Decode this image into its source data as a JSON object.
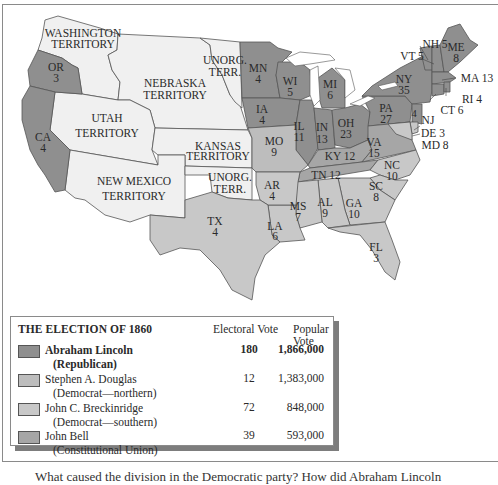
{
  "figure": {
    "type": "map"
  },
  "colors": {
    "lincoln": "#8f8f8f",
    "douglas": "#bdbdbd",
    "breckinridge": "#c8c8c8",
    "bell": "#a6a6a6",
    "territory": "#f0f0f0",
    "water": "#ffffff",
    "border": "#555555"
  },
  "territories": [
    {
      "id": "washington",
      "label": "WASHINGTON",
      "label2": "TERRITORY"
    },
    {
      "id": "nebraska",
      "label": "NEBRASKA",
      "label2": "TERRITORY"
    },
    {
      "id": "unorg-north",
      "label": "UNORG.",
      "label2": "TERR."
    },
    {
      "id": "utah",
      "label": "UTAH",
      "label2": "TERRITORY"
    },
    {
      "id": "kansas",
      "label": "KANSAS",
      "label2": "TERRITORY"
    },
    {
      "id": "new-mexico",
      "label": "NEW MEXICO",
      "label2": "TERRITORY"
    },
    {
      "id": "unorg-south",
      "label": "UNORG.",
      "label2": "TERR."
    }
  ],
  "states": [
    {
      "abbr": "OR",
      "ev": "3",
      "winner": "lincoln"
    },
    {
      "abbr": "CA",
      "ev": "4",
      "winner": "lincoln"
    },
    {
      "abbr": "MN",
      "ev": "4",
      "winner": "lincoln"
    },
    {
      "abbr": "WI",
      "ev": "5",
      "winner": "lincoln"
    },
    {
      "abbr": "MI",
      "ev": "6",
      "winner": "lincoln"
    },
    {
      "abbr": "IA",
      "ev": "4",
      "winner": "lincoln"
    },
    {
      "abbr": "IL",
      "ev": "11",
      "winner": "lincoln"
    },
    {
      "abbr": "IN",
      "ev": "13",
      "winner": "lincoln"
    },
    {
      "abbr": "OH",
      "ev": "23",
      "winner": "lincoln"
    },
    {
      "abbr": "PA",
      "ev": "27",
      "winner": "lincoln"
    },
    {
      "abbr": "NY",
      "ev": "35",
      "winner": "lincoln"
    },
    {
      "abbr": "NH",
      "ev": "5",
      "winner": "lincoln"
    },
    {
      "abbr": "VT",
      "ev": "5",
      "winner": "lincoln"
    },
    {
      "abbr": "ME",
      "ev": "8",
      "winner": "lincoln"
    },
    {
      "abbr": "MA",
      "ev": "13",
      "winner": "lincoln"
    },
    {
      "abbr": "RI",
      "ev": "4",
      "winner": "lincoln"
    },
    {
      "abbr": "CT",
      "ev": "6",
      "winner": "lincoln"
    },
    {
      "abbr": "NJ",
      "ev": "4",
      "winner": "lincoln"
    },
    {
      "abbr": "MO",
      "ev": "9",
      "winner": "douglas"
    },
    {
      "abbr": "KY",
      "ev": "12",
      "winner": "bell"
    },
    {
      "abbr": "VA",
      "ev": "15",
      "winner": "bell"
    },
    {
      "abbr": "TN",
      "ev": "12",
      "winner": "bell"
    },
    {
      "abbr": "DE",
      "ev": "3",
      "winner": "breckinridge"
    },
    {
      "abbr": "MD",
      "ev": "8",
      "winner": "breckinridge"
    },
    {
      "abbr": "NC",
      "ev": "10",
      "winner": "breckinridge"
    },
    {
      "abbr": "SC",
      "ev": "8",
      "winner": "breckinridge"
    },
    {
      "abbr": "GA",
      "ev": "10",
      "winner": "breckinridge"
    },
    {
      "abbr": "FL",
      "ev": "3",
      "winner": "breckinridge"
    },
    {
      "abbr": "AL",
      "ev": "9",
      "winner": "breckinridge"
    },
    {
      "abbr": "MS",
      "ev": "7",
      "winner": "breckinridge"
    },
    {
      "abbr": "LA",
      "ev": "6",
      "winner": "breckinridge"
    },
    {
      "abbr": "AR",
      "ev": "4",
      "winner": "breckinridge"
    },
    {
      "abbr": "TX",
      "ev": "4",
      "winner": "breckinridge"
    }
  ],
  "callouts": {
    "nh": "NH 5",
    "vt": "VT 5",
    "ma": "MA 13",
    "ri": "RI 4",
    "ct": "CT 6",
    "nj": "NJ",
    "nj_ev": "4",
    "de": "DE 3",
    "md": "MD 8",
    "ky": "KY 12",
    "tn": "TN 12"
  },
  "legend": {
    "title": "THE ELECTION OF 1860",
    "col_electoral": "Electoral Vote",
    "col_popular": "Popular Vote",
    "rows": [
      {
        "name": "Abraham Lincoln",
        "party": "(Republican)",
        "electoral": "180",
        "popular": "1,866,000",
        "key": "lincoln",
        "bold": true
      },
      {
        "name": "Stephen A. Douglas",
        "party": "(Democrat—northern)",
        "electoral": "12",
        "popular": "1,383,000",
        "key": "douglas",
        "bold": false
      },
      {
        "name": "John C. Breckinridge",
        "party": "(Democrat—southern)",
        "electoral": "72",
        "popular": "848,000",
        "key": "breckinridge",
        "bold": false
      },
      {
        "name": "John Bell",
        "party": "(Constitutional Union)",
        "electoral": "39",
        "popular": "593,000",
        "key": "bell",
        "bold": false
      }
    ]
  },
  "caption": "What caused the division in the Democratic party? How did Abraham Lincoln"
}
